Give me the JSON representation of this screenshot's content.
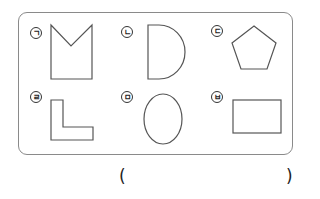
{
  "figure": {
    "items": [
      {
        "label": "ㄱ",
        "shape": "pentagon-notched-square"
      },
      {
        "label": "ㄴ",
        "shape": "d-shape"
      },
      {
        "label": "ㄷ",
        "shape": "pentagon"
      },
      {
        "label": "ㄹ",
        "shape": "l-shape"
      },
      {
        "label": "ㅁ",
        "shape": "ellipse"
      },
      {
        "label": "ㅂ",
        "shape": "rectangle"
      }
    ]
  },
  "answer": {
    "open_paren": "(",
    "close_paren": ")"
  }
}
